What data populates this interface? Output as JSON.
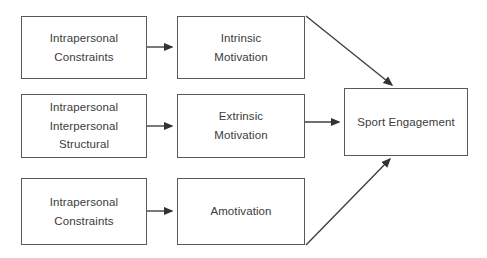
{
  "diagram": {
    "type": "flow-diagram",
    "canvas": {
      "width": 487,
      "height": 258
    },
    "style": {
      "background": "#ffffff",
      "box_border": "#595959",
      "box_fill": "#ffffff",
      "text_color": "#3b3b3b",
      "connector_color": "#404040"
    },
    "nodes": [
      {
        "id": "constraints-top",
        "column": 1,
        "row": 1,
        "lines": [
          "Intrapersonal",
          "Constraints"
        ]
      },
      {
        "id": "constraints-mid",
        "column": 1,
        "row": 2,
        "lines": [
          "Intrapersonal",
          "Interpersonal",
          "Structural"
        ]
      },
      {
        "id": "constraints-bottom",
        "column": 1,
        "row": 3,
        "lines": [
          "Intrapersonal",
          "Constraints"
        ]
      },
      {
        "id": "intrinsic",
        "column": 2,
        "row": 1,
        "lines": [
          "Intrinsic",
          "Motivation"
        ]
      },
      {
        "id": "extrinsic",
        "column": 2,
        "row": 2,
        "lines": [
          "Extrinsic",
          "Motivation"
        ]
      },
      {
        "id": "amotivation",
        "column": 2,
        "row": 3,
        "lines": [
          "Amotivation"
        ]
      },
      {
        "id": "engagement",
        "column": 3,
        "row": 2,
        "lines": [
          "Sport Engagement"
        ]
      }
    ],
    "edges": [
      {
        "id": "e1",
        "from": "constraints-top",
        "to": "intrinsic",
        "shape": "horizontal-arrow"
      },
      {
        "id": "e2",
        "from": "constraints-mid",
        "to": "extrinsic",
        "shape": "horizontal-arrow"
      },
      {
        "id": "e3",
        "from": "constraints-bottom",
        "to": "amotivation",
        "shape": "horizontal-arrow"
      },
      {
        "id": "e4",
        "from": "intrinsic",
        "to": "engagement",
        "shape": "diagonal-arrow-down"
      },
      {
        "id": "e5",
        "from": "extrinsic",
        "to": "engagement",
        "shape": "horizontal-arrow"
      },
      {
        "id": "e6",
        "from": "amotivation",
        "to": "engagement",
        "shape": "diagonal-arrow-up"
      }
    ]
  },
  "nodes": {
    "constraints_top": {
      "line1": "Intrapersonal",
      "line2": "Constraints"
    },
    "constraints_mid": {
      "line1": "Intrapersonal",
      "line2": "Interpersonal",
      "line3": "Structural"
    },
    "constraints_bottom": {
      "line1": "Intrapersonal",
      "line2": "Constraints"
    },
    "intrinsic": {
      "line1": "Intrinsic",
      "line2": "Motivation"
    },
    "extrinsic": {
      "line1": "Extrinsic",
      "line2": "Motivation"
    },
    "amotivation": {
      "line1": "Amotivation"
    },
    "engagement": {
      "line1": "Sport Engagement"
    }
  }
}
